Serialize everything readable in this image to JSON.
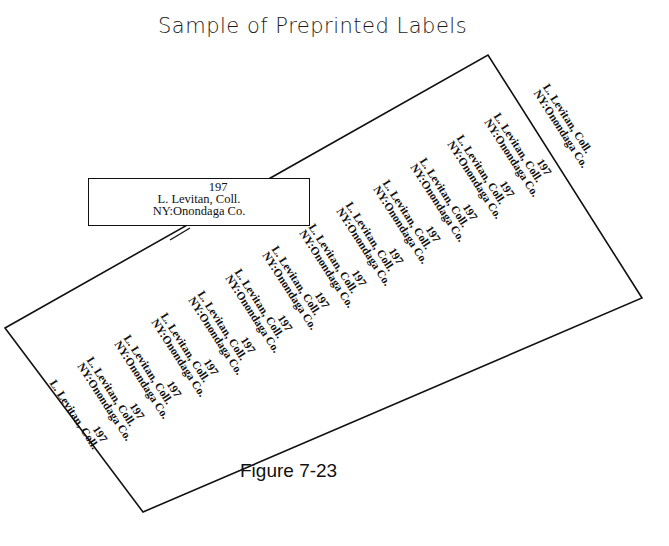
{
  "title": "Sample of Preprinted Labels",
  "inset_label": {
    "year": "197",
    "collector": "L.  Levitan, Coll.",
    "locality": "NY:Onondaga Co."
  },
  "sheet_labels": [
    {
      "year": "197",
      "collector": "L. Levitan, Coll.",
      "locality": ""
    },
    {
      "year": "197",
      "collector": "L. Levitan, Coll.",
      "locality": "NY:Onondaga Co."
    },
    {
      "year": "197",
      "collector": "L. Levitan, Coll.",
      "locality": "NY:Onondaga Co."
    },
    {
      "year": "197",
      "collector": "L. Levitan, Coll.",
      "locality": "NY:Onondaga Co."
    },
    {
      "year": "197",
      "collector": "L. Levitan, Coll.",
      "locality": "NY:Onondaga Co."
    },
    {
      "year": "197",
      "collector": "L. Levitan, Coll.",
      "locality": "NY:Onondaga Co."
    },
    {
      "year": "197",
      "collector": "L. Levitan, Coll.",
      "locality": "NY:Onondaga Co."
    },
    {
      "year": "197",
      "collector": "L. Levitan, Coll.",
      "locality": "NY:Onondaga Co."
    },
    {
      "year": "197",
      "collector": "L. Levitan, Coll.",
      "locality": "NY:Onondaga Co."
    },
    {
      "year": "197",
      "collector": "L. Levitan, Coll.",
      "locality": "NY:Onondaga Co."
    },
    {
      "year": "197",
      "collector": "L. Levitan, Coll.",
      "locality": "NY:Onondaga Co."
    },
    {
      "year": "197",
      "collector": "L. Levitan, Coll.",
      "locality": "NY:Onondaga Co."
    },
    {
      "year": "197",
      "collector": "L. Levitan, Coll.",
      "locality": "NY:Onondaga Co."
    },
    {
      "year": "",
      "collector": "L. Levitan, Coll.",
      "locality": "NY:Onondaga Co."
    }
  ],
  "caption": "Figure 7-23"
}
